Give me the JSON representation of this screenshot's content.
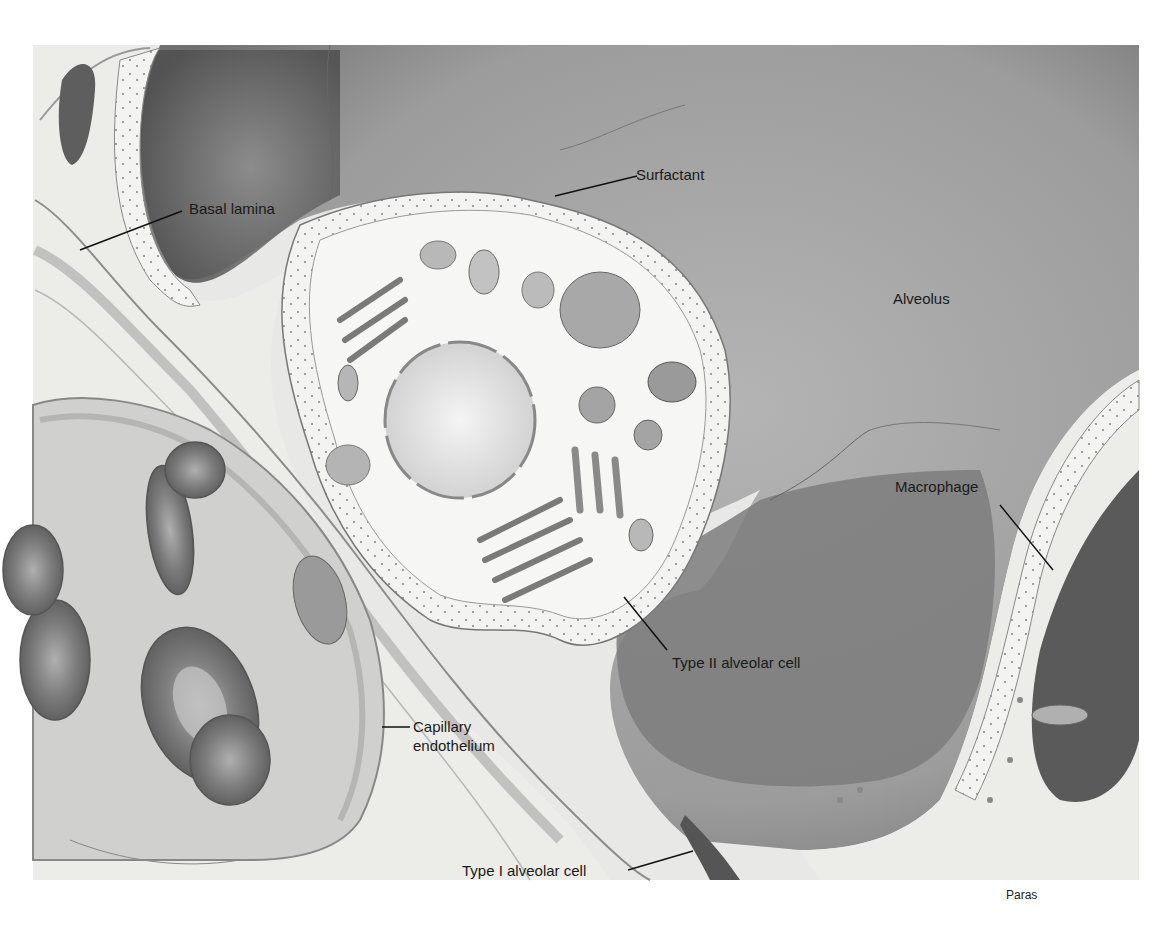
{
  "figure": {
    "credit": "Paras"
  },
  "labels": {
    "surfactant": "Surfactant",
    "basal_lamina": "Basal lamina",
    "alveolus": "Alveolus",
    "macrophage": "Macrophage",
    "type2": "Type II alveolar cell",
    "capillary_line1": "Capillary",
    "capillary_line2": "endothelium",
    "type1": "Type I alveolar cell"
  },
  "colors": {
    "background": "#ffffff",
    "tissue_light": "#ececea",
    "alveolus_gray": "#a9a9a9",
    "alveolus_dark": "#6f6f6f",
    "cell_fill": "#f2f2f0",
    "rbc": "#8a8a8a",
    "text": "#1a1a1a"
  }
}
